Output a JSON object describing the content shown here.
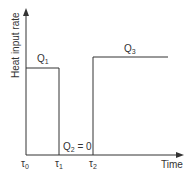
{
  "diagram": {
    "y_axis_label": "Heat input rate",
    "x_axis_label": "Time",
    "ticks": [
      {
        "sym": "τ",
        "sub": "0"
      },
      {
        "sym": "τ",
        "sub": "1"
      },
      {
        "sym": "τ",
        "sub": "2"
      }
    ],
    "segments": [
      {
        "sym": "Q",
        "sub": "1",
        "suffix": ""
      },
      {
        "sym": "Q",
        "sub": "2",
        "suffix": " = 0"
      },
      {
        "sym": "Q",
        "sub": "3",
        "suffix": ""
      }
    ],
    "colors": {
      "line": "#333333",
      "background": "#ffffff"
    }
  }
}
